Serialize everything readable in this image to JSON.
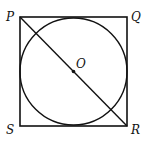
{
  "diagram": {
    "labels": {
      "P": "P",
      "Q": "Q",
      "R": "R",
      "S": "S",
      "O": "O"
    },
    "colors": {
      "stroke": "#111111",
      "background": "#ffffff"
    }
  }
}
